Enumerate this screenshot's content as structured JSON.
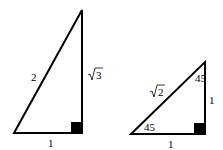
{
  "triangles": [
    {
      "name": "30-60-90 triangle",
      "labels": {
        "hypotenuse": "2",
        "base": "1",
        "height_radicand": "3"
      }
    },
    {
      "name": "45-45-90 triangle",
      "labels": {
        "hypotenuse_radicand": "2",
        "base": "1",
        "height": "1",
        "angle_bottom_left": "45",
        "angle_top": "45"
      }
    }
  ]
}
